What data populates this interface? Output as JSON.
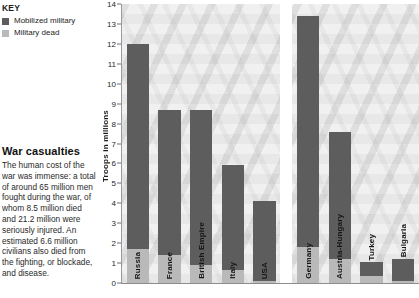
{
  "key": {
    "title": "KEY",
    "items": [
      {
        "label": "Mobilized military",
        "color": "#5d5d5d",
        "icon": "legend-swatch-icon"
      },
      {
        "label": "Military dead",
        "color": "#b9b9b9",
        "icon": "legend-swatch-icon"
      }
    ]
  },
  "caption": {
    "title": "War casualties",
    "body": "The human cost of the war was immense: a total of around 65 million men fought during the war, of whom 8.5 million died and 21.2 million were seriously injured. An estimated 6.6 million civilians also died from the fighting, or blockade, and disease."
  },
  "chart_data": {
    "type": "bar",
    "title": "",
    "xlabel": "",
    "ylabel": "Troops in millions",
    "ylim": [
      0,
      14
    ],
    "yticks": [
      0,
      1,
      2,
      3,
      4,
      5,
      6,
      7,
      8,
      9,
      10,
      11,
      12,
      13,
      14
    ],
    "ytick_labels": [
      "0",
      "1",
      "2",
      "3",
      "4",
      "5",
      "6",
      "7",
      "8",
      "9",
      "10",
      "11",
      "12",
      "13",
      "14"
    ],
    "grid": false,
    "legend_position": "top-left-outside",
    "categories": [
      "Russia",
      "France",
      "British Empire",
      "Italy",
      "USA",
      "Germany",
      "Austria-Hungary",
      "Turkey",
      "Bulgaria"
    ],
    "series": [
      {
        "name": "Mobilized military",
        "color": "#5d5d5d",
        "values": [
          12.0,
          8.7,
          8.7,
          5.9,
          4.1,
          13.4,
          7.6,
          1.05,
          1.2
        ]
      },
      {
        "name": "Military dead",
        "color": "#b9b9b9",
        "values": [
          1.7,
          1.4,
          0.9,
          0.65,
          0.12,
          1.8,
          1.2,
          0.33,
          0.09
        ]
      }
    ],
    "groups": [
      {
        "name": "Allied Powers",
        "categories": [
          "Russia",
          "France",
          "British Empire",
          "Italy",
          "USA"
        ]
      },
      {
        "name": "Central Powers",
        "categories": [
          "Germany",
          "Austria-Hungary",
          "Turkey",
          "Bulgaria"
        ]
      }
    ],
    "bars": [
      {
        "label": "Russia",
        "mobilized": 12.0,
        "dead": 1.7,
        "group": 0,
        "label_inside": true
      },
      {
        "label": "France",
        "mobilized": 8.7,
        "dead": 1.4,
        "group": 0,
        "label_inside": true
      },
      {
        "label": "British Empire",
        "mobilized": 8.7,
        "dead": 0.9,
        "group": 0,
        "label_inside": true
      },
      {
        "label": "Italy",
        "mobilized": 5.9,
        "dead": 0.65,
        "group": 0,
        "label_inside": true
      },
      {
        "label": "USA",
        "mobilized": 4.1,
        "dead": 0.12,
        "group": 0,
        "label_inside": true
      },
      {
        "label": "Germany",
        "mobilized": 13.4,
        "dead": 1.8,
        "group": 1,
        "label_inside": true
      },
      {
        "label": "Austria-Hungary",
        "mobilized": 7.6,
        "dead": 1.2,
        "group": 1,
        "label_inside": true
      },
      {
        "label": "Turkey",
        "mobilized": 1.05,
        "dead": 0.33,
        "group": 1,
        "label_inside": false
      },
      {
        "label": "Bulgaria",
        "mobilized": 1.2,
        "dead": 0.09,
        "group": 1,
        "label_inside": false
      }
    ]
  }
}
